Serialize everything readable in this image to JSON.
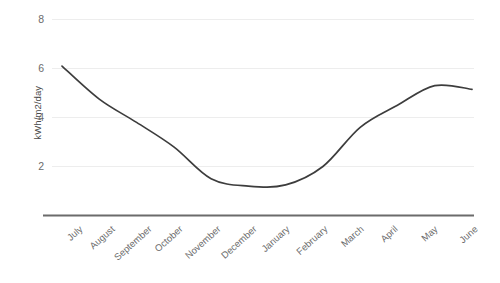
{
  "chart_data": {
    "type": "line",
    "title": "",
    "subtitle": "",
    "xlabel": "",
    "ylabel": "kWh/m2/day",
    "categories": [
      "July",
      "August",
      "September",
      "October",
      "November",
      "December",
      "January",
      "February",
      "March",
      "April",
      "May",
      "June"
    ],
    "values": [
      6.1,
      4.75,
      3.8,
      2.8,
      1.5,
      1.2,
      1.25,
      2.0,
      3.6,
      4.5,
      5.3,
      5.15
    ],
    "series": [
      {
        "name": "kWh/m2/day",
        "values": [
          6.1,
          4.75,
          3.8,
          2.8,
          1.5,
          1.2,
          1.25,
          2.0,
          3.6,
          4.5,
          5.3,
          5.15
        ]
      }
    ],
    "ylim": [
      0,
      8
    ],
    "yticks": [
      2,
      4,
      6,
      8
    ],
    "ytick_labels": [
      "2",
      "4",
      "6",
      "8"
    ],
    "grid": true,
    "grid_axis": "y",
    "legend": false,
    "legend_position": "none",
    "line_color": "#3d3d3d",
    "grid_color": "#ededed",
    "axis_color": "#595959",
    "background_color": "#ffffff",
    "markers": false,
    "smoothing": "spline"
  },
  "axis": {
    "y_title": "kWh/m2/day",
    "y_tick_labels": [
      "8",
      "6",
      "4",
      "2"
    ],
    "x_tick_labels": [
      "July",
      "August",
      "September",
      "October",
      "November",
      "December",
      "January",
      "February",
      "March",
      "April",
      "May",
      "June"
    ]
  }
}
